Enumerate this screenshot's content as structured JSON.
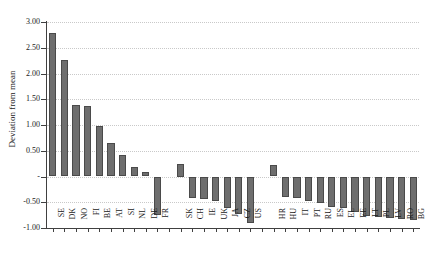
{
  "figure": {
    "clipped_header_text": "",
    "background": "#ffffff",
    "bar_fill": "#6e6e6e",
    "bar_edge": "#4a4a4a",
    "grid_color": "#c9c9c9",
    "axis_color": "#404040"
  },
  "chart_data": {
    "type": "bar",
    "title": "",
    "xlabel": "",
    "ylabel": "Deviation from mean",
    "ylim": [
      -1.0,
      3.0
    ],
    "ytick_values": [
      -1.0,
      -0.5,
      0.0,
      0.5,
      1.0,
      1.5,
      2.0,
      2.5,
      3.0
    ],
    "ytick_labels": [
      "-1.00",
      "-0.50",
      "-",
      "0.50",
      "1.00",
      "1.50",
      "2.00",
      "2.50",
      "3.00"
    ],
    "grid": true,
    "grid_axis": "y",
    "legend": "none",
    "groups": [
      {
        "name": "group-1",
        "categories": [
          "SE",
          "DK",
          "NO",
          "FI",
          "BE",
          "AT",
          "SI",
          "NL",
          "DE",
          "FR"
        ],
        "values": [
          2.78,
          2.26,
          1.38,
          1.36,
          0.98,
          0.65,
          0.41,
          0.19,
          0.08,
          -0.75
        ]
      },
      {
        "name": "group-2",
        "categories": [
          "SK",
          "CH",
          "IE",
          "UK",
          "JA",
          "CZ",
          "US"
        ],
        "values": [
          0.25,
          -0.41,
          -0.43,
          -0.48,
          -0.62,
          -0.73,
          -0.9
        ]
      },
      {
        "name": "group-3",
        "categories": [
          "HR",
          "HU",
          "IT",
          "PT",
          "RU",
          "ES",
          "EL",
          "EE",
          "LT",
          "PL",
          "LV",
          "RO",
          "BG"
        ],
        "values": [
          0.23,
          -0.4,
          -0.41,
          -0.48,
          -0.52,
          -0.59,
          -0.61,
          -0.69,
          -0.77,
          -0.78,
          -0.8,
          -0.82,
          -0.85
        ]
      }
    ],
    "categories": [
      "SE",
      "DK",
      "NO",
      "FI",
      "BE",
      "AT",
      "SI",
      "NL",
      "DE",
      "FR",
      "SK",
      "CH",
      "IE",
      "UK",
      "JA",
      "CZ",
      "US",
      "HR",
      "HU",
      "IT",
      "PT",
      "RU",
      "ES",
      "EL",
      "EE",
      "LT",
      "PL",
      "LV",
      "RO",
      "BG"
    ],
    "values": [
      2.78,
      2.26,
      1.38,
      1.36,
      0.98,
      0.65,
      0.41,
      0.19,
      0.08,
      -0.75,
      0.25,
      -0.41,
      -0.43,
      -0.48,
      -0.62,
      -0.73,
      -0.9,
      0.23,
      -0.4,
      -0.41,
      -0.48,
      -0.52,
      -0.59,
      -0.61,
      -0.69,
      -0.77,
      -0.78,
      -0.8,
      -0.82,
      -0.85
    ]
  }
}
